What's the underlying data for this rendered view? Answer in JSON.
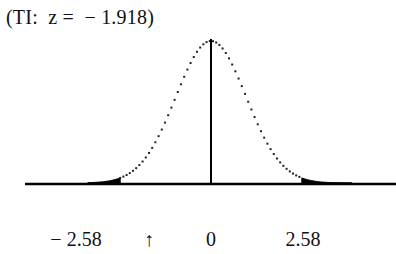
{
  "chart_data": {
    "type": "area",
    "title": "(TI:  z =  − 1.918)",
    "distribution": "standard normal",
    "mean": 0,
    "sd": 1,
    "xlim": [
      -3.5,
      4.0
    ],
    "critical_values": [
      -2.58,
      2.58
    ],
    "shaded_regions": [
      {
        "name": "left-rejection-region",
        "from": -3.5,
        "to": -2.58
      },
      {
        "name": "right-rejection-region",
        "from": 2.58,
        "to": 4.0
      }
    ],
    "test_statistic": -1.918,
    "center_line_at": 0,
    "tick_labels": [
      {
        "text": "− 2.58",
        "x": -2.58
      },
      {
        "text": "↑",
        "x": -1.918
      },
      {
        "text": "0",
        "x": 0
      },
      {
        "text": "2.58",
        "x": 2.58
      }
    ],
    "xlabel": "",
    "ylabel": "",
    "grid": false,
    "legend": "none"
  }
}
